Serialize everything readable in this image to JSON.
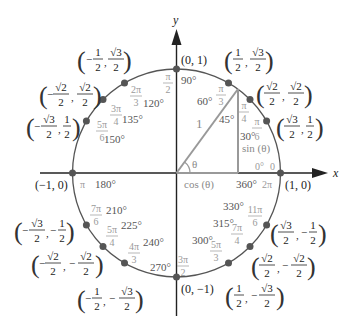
{
  "colors": {
    "axis": "#222222",
    "circle": "#555555",
    "triangle": "#999999",
    "point": "#555555",
    "degree_text": "#555555",
    "radian_text": "#9a9a9a",
    "coordinate_text": "#222222"
  },
  "axes": {
    "x_label": "x",
    "y_label": "y"
  },
  "triangle": {
    "hypotenuse_label": "1",
    "angle_label": "θ",
    "cos_label": "cos (θ)",
    "sin_label": "sin (θ)"
  },
  "axis_points": [
    {
      "angle": 0,
      "coord": "(1, 0)"
    },
    {
      "angle": 90,
      "coord": "(0, 1)"
    },
    {
      "angle": 180,
      "coord": "(−1, 0)"
    },
    {
      "angle": 270,
      "coord": "(0, −1)"
    }
  ],
  "points": [
    {
      "angle": 30,
      "x": "√3/2",
      "y": "1/2",
      "xn": "√3",
      "xd": "2",
      "yn": "1",
      "yd": "2",
      "xs": "",
      "ys": ""
    },
    {
      "angle": 45,
      "x": "√2/2",
      "y": "√2/2",
      "xn": "√2",
      "xd": "2",
      "yn": "√2",
      "yd": "2",
      "xs": "",
      "ys": ""
    },
    {
      "angle": 60,
      "x": "1/2",
      "y": "√3/2",
      "xn": "1",
      "xd": "2",
      "yn": "√3",
      "yd": "2",
      "xs": "",
      "ys": ""
    },
    {
      "angle": 120,
      "x": "−1/2",
      "y": "√3/2",
      "xn": "1",
      "xd": "2",
      "yn": "√3",
      "yd": "2",
      "xs": "−",
      "ys": ""
    },
    {
      "angle": 135,
      "x": "−√2/2",
      "y": "√2/2",
      "xn": "√2",
      "xd": "2",
      "yn": "√2",
      "yd": "2",
      "xs": "−",
      "ys": ""
    },
    {
      "angle": 150,
      "x": "−√3/2",
      "y": "1/2",
      "xn": "√3",
      "xd": "2",
      "yn": "1",
      "yd": "2",
      "xs": "−",
      "ys": ""
    },
    {
      "angle": 210,
      "x": "−√3/2",
      "y": "−1/2",
      "xn": "√3",
      "xd": "2",
      "yn": "1",
      "yd": "2",
      "xs": "−",
      "ys": "−"
    },
    {
      "angle": 225,
      "x": "−√2/2",
      "y": "−√2/2",
      "xn": "√2",
      "xd": "2",
      "yn": "√2",
      "yd": "2",
      "xs": "−",
      "ys": "−"
    },
    {
      "angle": 240,
      "x": "−1/2",
      "y": "−√3/2",
      "xn": "1",
      "xd": "2",
      "yn": "√3",
      "yd": "2",
      "xs": "−",
      "ys": "−"
    },
    {
      "angle": 300,
      "x": "1/2",
      "y": "−√3/2",
      "xn": "1",
      "xd": "2",
      "yn": "√3",
      "yd": "2",
      "xs": "",
      "ys": "−"
    },
    {
      "angle": 315,
      "x": "√2/2",
      "y": "−√2/2",
      "xn": "√2",
      "xd": "2",
      "yn": "√2",
      "yd": "2",
      "xs": "",
      "ys": "−"
    },
    {
      "angle": 330,
      "x": "√3/2",
      "y": "−1/2",
      "xn": "√3",
      "xd": "2",
      "yn": "1",
      "yd": "2",
      "xs": "",
      "ys": "−"
    }
  ],
  "angle_labels": [
    {
      "deg": "0°",
      "rad": "0"
    },
    {
      "deg": "30°",
      "rad_n": "π",
      "rad_d": "6"
    },
    {
      "deg": "45°",
      "rad_n": "π",
      "rad_d": "4"
    },
    {
      "deg": "60°",
      "rad_n": "π",
      "rad_d": "3"
    },
    {
      "deg": "90°",
      "rad_n": "π",
      "rad_d": "2"
    },
    {
      "deg": "120°",
      "rad_n": "2π",
      "rad_d": "3"
    },
    {
      "deg": "135°",
      "rad_n": "3π",
      "rad_d": "4"
    },
    {
      "deg": "150°",
      "rad_n": "5π",
      "rad_d": "6"
    },
    {
      "deg": "180°",
      "rad": "π"
    },
    {
      "deg": "210°",
      "rad_n": "7π",
      "rad_d": "6"
    },
    {
      "deg": "225°",
      "rad_n": "5π",
      "rad_d": "4"
    },
    {
      "deg": "240°",
      "rad_n": "4π",
      "rad_d": "3"
    },
    {
      "deg": "270°",
      "rad_n": "3π",
      "rad_d": "2"
    },
    {
      "deg": "300°",
      "rad_n": "5π",
      "rad_d": "3"
    },
    {
      "deg": "315°",
      "rad_n": "7π",
      "rad_d": "4"
    },
    {
      "deg": "330°",
      "rad_n": "11π",
      "rad_d": "6"
    },
    {
      "deg": "360°",
      "rad": "2π"
    }
  ]
}
